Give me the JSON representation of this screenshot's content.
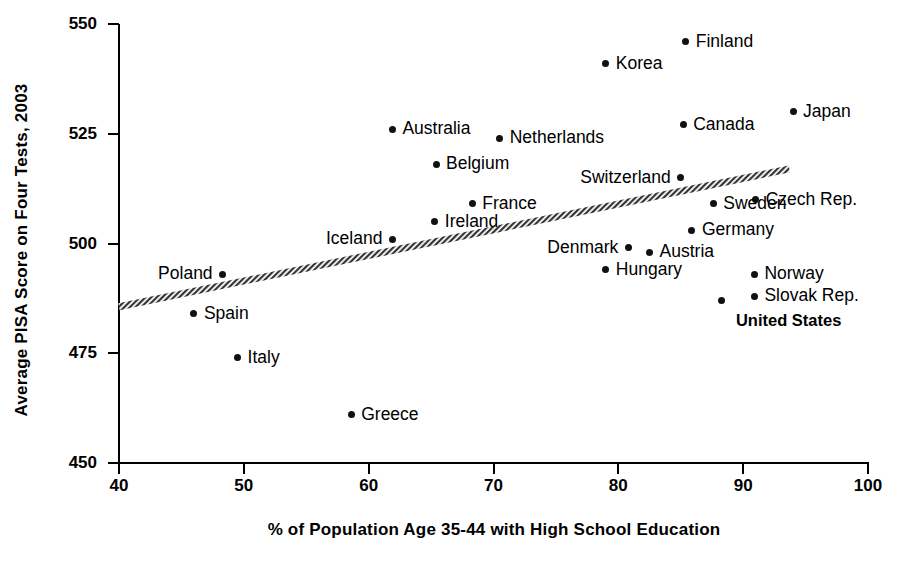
{
  "chart_data": {
    "type": "scatter",
    "title": "",
    "xlabel": "% of Population Age 35-44 with High School Education",
    "ylabel": "Average PISA Score on Four Tests, 2003",
    "xlim": [
      40,
      100
    ],
    "ylim": [
      450,
      550
    ],
    "xticks": [
      40,
      50,
      60,
      70,
      80,
      90,
      100
    ],
    "yticks": [
      450,
      475,
      500,
      525,
      550
    ],
    "grid": false,
    "legend": null,
    "point_color": "#111111",
    "trendline": {
      "type": "linear",
      "color": "#555555",
      "x_start": 40,
      "y_start": 485.6,
      "x_end": 93.7,
      "y_end": 517.0
    },
    "points": [
      {
        "label": "Finland",
        "x": 85.4,
        "y": 546,
        "label_side": "right",
        "bold": false
      },
      {
        "label": "Korea",
        "x": 79.0,
        "y": 541,
        "label_side": "right",
        "bold": false
      },
      {
        "label": "Japan",
        "x": 94.0,
        "y": 530,
        "label_side": "right",
        "bold": false
      },
      {
        "label": "Canada",
        "x": 85.2,
        "y": 527,
        "label_side": "right",
        "bold": false
      },
      {
        "label": "Australia",
        "x": 61.9,
        "y": 526,
        "label_side": "right",
        "bold": false
      },
      {
        "label": "Netherlands",
        "x": 70.5,
        "y": 524,
        "label_side": "right",
        "bold": false
      },
      {
        "label": "Belgium",
        "x": 65.4,
        "y": 518,
        "label_side": "right",
        "bold": false
      },
      {
        "label": "Switzerland",
        "x": 85.0,
        "y": 515,
        "label_side": "left",
        "bold": false
      },
      {
        "label": "France",
        "x": 68.3,
        "y": 509,
        "label_side": "right",
        "bold": false
      },
      {
        "label": "Czech Rep.",
        "x": 91.0,
        "y": 510,
        "label_side": "right",
        "bold": false
      },
      {
        "label": "Sweden",
        "x": 87.6,
        "y": 509,
        "label_side": "right",
        "bold": false
      },
      {
        "label": "Ireland",
        "x": 65.3,
        "y": 505,
        "label_side": "right",
        "bold": false
      },
      {
        "label": "Germany",
        "x": 85.9,
        "y": 503,
        "label_side": "right",
        "bold": false
      },
      {
        "label": "Iceland",
        "x": 61.9,
        "y": 501,
        "label_side": "left",
        "bold": false
      },
      {
        "label": "Denmark",
        "x": 80.8,
        "y": 499,
        "label_side": "left",
        "bold": false
      },
      {
        "label": "Austria",
        "x": 82.5,
        "y": 498,
        "label_side": "right",
        "bold": false
      },
      {
        "label": "Poland",
        "x": 48.3,
        "y": 493,
        "label_side": "left",
        "bold": false
      },
      {
        "label": "Hungary",
        "x": 79.0,
        "y": 494,
        "label_side": "right",
        "bold": false
      },
      {
        "label": "Norway",
        "x": 90.9,
        "y": 493,
        "label_side": "right",
        "bold": false
      },
      {
        "label": "Slovak Rep.",
        "x": 90.9,
        "y": 488,
        "label_side": "right",
        "bold": false
      },
      {
        "label": "United States",
        "x": 88.3,
        "y": 487,
        "label_side": "right",
        "bold": true
      },
      {
        "label": "Spain",
        "x": 46.0,
        "y": 484,
        "label_side": "right",
        "bold": false
      },
      {
        "label": "Italy",
        "x": 49.5,
        "y": 474,
        "label_side": "right",
        "bold": false
      },
      {
        "label": "Greece",
        "x": 58.6,
        "y": 461,
        "label_side": "right",
        "bold": false
      }
    ]
  }
}
